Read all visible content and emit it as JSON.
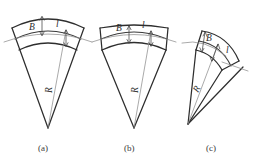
{
  "figure": {
    "background_color": "#ffffff",
    "stroke_color": "#3a3a3a",
    "thin_stroke_color": "#8d8d8d",
    "width": 265,
    "height": 158,
    "panels": [
      {
        "id": "a",
        "caption": "(a)",
        "caption_x": 46,
        "caption_y": 150,
        "labels": {
          "width_label": "B",
          "length_label": "l",
          "radius_label": "R"
        }
      },
      {
        "id": "b",
        "caption": "(b)",
        "caption_x": 133,
        "caption_y": 150,
        "labels": {
          "width_label": "B",
          "length_label": "l",
          "radius_label": "R"
        }
      },
      {
        "id": "c",
        "caption": "(c)",
        "caption_x": 215,
        "caption_y": 150,
        "labels": {
          "width_label": "B",
          "length_label": "l",
          "radius_label": "R"
        }
      }
    ]
  }
}
